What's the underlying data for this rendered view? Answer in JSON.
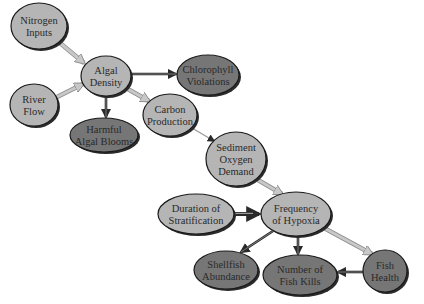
{
  "diagram": {
    "colors": {
      "light_node": "#b5b5b5",
      "dark_node": "#767676",
      "node_border": "#1a1a1a",
      "shadow": "#2b2b2b",
      "arrow_dark": "#2a2a2a",
      "arrow_light": "#c8c8c8",
      "text": "#2a2a2a"
    },
    "nodes": [
      {
        "id": "nitrogen",
        "lines": [
          "Nitrogen",
          "Inputs"
        ],
        "cx": 39,
        "cy": 26,
        "rx": 28,
        "ry": 23,
        "shade": "light"
      },
      {
        "id": "algal_density",
        "lines": [
          "Algal",
          "Density"
        ],
        "cx": 106,
        "cy": 76,
        "rx": 25,
        "ry": 20,
        "shade": "light"
      },
      {
        "id": "river_flow",
        "lines": [
          "River",
          "Flow"
        ],
        "cx": 34,
        "cy": 105,
        "rx": 24,
        "ry": 21,
        "shade": "light"
      },
      {
        "id": "chlorophyll",
        "lines": [
          "Chlorophyll",
          "Violations"
        ],
        "cx": 208,
        "cy": 75,
        "rx": 31,
        "ry": 20,
        "shade": "dark"
      },
      {
        "id": "carbon_production",
        "lines": [
          "Carbon",
          "Production"
        ],
        "cx": 170,
        "cy": 115,
        "rx": 27,
        "ry": 21,
        "shade": "light"
      },
      {
        "id": "harmful_algal_blooms",
        "lines": [
          "Harmful",
          "Algal Blooms"
        ],
        "cx": 104,
        "cy": 135,
        "rx": 34,
        "ry": 17,
        "shade": "dark"
      },
      {
        "id": "sediment_oxygen_demand",
        "lines": [
          "Sediment",
          "Oxygen",
          "Demand"
        ],
        "cx": 236,
        "cy": 159,
        "rx": 30,
        "ry": 27,
        "shade": "light"
      },
      {
        "id": "duration_of_stratification",
        "lines": [
          "Duration of",
          "Stratification"
        ],
        "cx": 196,
        "cy": 214,
        "rx": 38,
        "ry": 20,
        "shade": "light"
      },
      {
        "id": "frequency_of_hypoxia",
        "lines": [
          "Frequency",
          "of Hypoxia"
        ],
        "cx": 296,
        "cy": 214,
        "rx": 35,
        "ry": 22,
        "shade": "light"
      },
      {
        "id": "shellfish_abundance",
        "lines": [
          "Shellfish",
          "Abundance"
        ],
        "cx": 226,
        "cy": 270,
        "rx": 32,
        "ry": 19,
        "shade": "dark"
      },
      {
        "id": "number_of_fish_kills",
        "lines": [
          "Number of",
          "Fish Kills"
        ],
        "cx": 300,
        "cy": 275,
        "rx": 37,
        "ry": 20,
        "shade": "dark"
      },
      {
        "id": "fish_health",
        "lines": [
          "Fish",
          "Health"
        ],
        "cx": 385,
        "cy": 271,
        "rx": 22,
        "ry": 21,
        "shade": "dark"
      }
    ],
    "edges": [
      {
        "from": "nitrogen",
        "to": "algal_density",
        "x1": 60,
        "y1": 43,
        "x2": 84,
        "y2": 63,
        "style": "light-thick"
      },
      {
        "from": "river_flow",
        "to": "algal_density",
        "x1": 57,
        "y1": 97,
        "x2": 83,
        "y2": 84,
        "style": "light-thick"
      },
      {
        "from": "algal_density",
        "to": "chlorophyll",
        "x1": 131,
        "y1": 74,
        "x2": 176,
        "y2": 74,
        "style": "dark"
      },
      {
        "from": "algal_density",
        "to": "harmful_algal_blooms",
        "x1": 106,
        "y1": 96,
        "x2": 106,
        "y2": 117,
        "style": "dark"
      },
      {
        "from": "algal_density",
        "to": "carbon_production",
        "x1": 126,
        "y1": 88,
        "x2": 149,
        "y2": 101,
        "style": "light-thick"
      },
      {
        "from": "carbon_production",
        "to": "sediment_oxygen_demand",
        "x1": 192,
        "y1": 128,
        "x2": 214,
        "y2": 141,
        "style": "thin"
      },
      {
        "from": "sediment_oxygen_demand",
        "to": "frequency_of_hypoxia",
        "x1": 258,
        "y1": 180,
        "x2": 282,
        "y2": 194,
        "style": "light-thick"
      },
      {
        "from": "duration_of_stratification",
        "to": "frequency_of_hypoxia",
        "x1": 234,
        "y1": 214,
        "x2": 259,
        "y2": 214,
        "style": "dark-thick"
      },
      {
        "from": "frequency_of_hypoxia",
        "to": "shellfish_abundance",
        "x1": 273,
        "y1": 231,
        "x2": 241,
        "y2": 252,
        "style": "dark"
      },
      {
        "from": "frequency_of_hypoxia",
        "to": "number_of_fish_kills",
        "x1": 298,
        "y1": 236,
        "x2": 298,
        "y2": 254,
        "style": "dark"
      },
      {
        "from": "frequency_of_hypoxia",
        "to": "fish_health",
        "x1": 324,
        "y1": 228,
        "x2": 372,
        "y2": 254,
        "style": "light-thick"
      },
      {
        "from": "fish_health",
        "to": "number_of_fish_kills",
        "x1": 363,
        "y1": 272,
        "x2": 338,
        "y2": 272,
        "style": "dark"
      }
    ]
  }
}
